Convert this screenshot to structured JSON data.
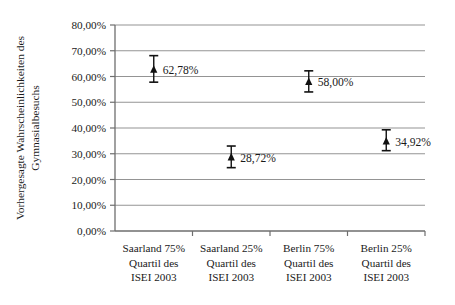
{
  "chart_data": {
    "type": "scatter",
    "title": "",
    "xlabel": "",
    "ylabel_lines": [
      "Vorhergesagte Wahrscheinlichkeiten des",
      "Gymnasialbesuchs"
    ],
    "ylabel": "Vorhergesagte Wahrscheinlichkeiten des Gymnasialbesuchs",
    "ylim": [
      0,
      80
    ],
    "ytick_values": [
      0,
      10,
      20,
      30,
      40,
      50,
      60,
      70,
      80
    ],
    "ytick_labels": [
      "0,00%",
      "10,00%",
      "20,00%",
      "30,00%",
      "40,00%",
      "50,00%",
      "60,00%",
      "70,00%",
      "80,00%"
    ],
    "grid": true,
    "legend": "none",
    "categories": [
      "Saarland 75% Quartil des ISEI 2003",
      "Saarland 25% Quartil des ISEI 2003",
      "Berlin 75% Quartil des ISEI 2003",
      "Berlin 25% Quartil des ISEI 2003"
    ],
    "category_label_lines": [
      [
        "Saarland 75%",
        "Quartil des",
        "ISEI 2003"
      ],
      [
        "Saarland 25%",
        "Quartil des",
        "ISEI 2003"
      ],
      [
        "Berlin 75%",
        "Quartil des",
        "ISEI 2003"
      ],
      [
        "Berlin 25%",
        "Quartil des",
        "ISEI 2003"
      ]
    ],
    "values": [
      62.78,
      28.72,
      58.0,
      34.92
    ],
    "value_labels": [
      "62,78%",
      "58,00%",
      "28,72%",
      "34,92%"
    ],
    "points": [
      {
        "category": "Saarland 75% Quartil des ISEI 2003",
        "value": 62.78,
        "label": "62,78%",
        "err_low": 57.8,
        "err_high": 68.1
      },
      {
        "category": "Saarland 25% Quartil des ISEI 2003",
        "value": 28.72,
        "label": "28,72%",
        "err_low": 24.6,
        "err_high": 33.0
      },
      {
        "category": "Berlin 75% Quartil des ISEI 2003",
        "value": 58.0,
        "label": "58,00%",
        "err_low": 54.0,
        "err_high": 62.2
      },
      {
        "category": "Berlin 25% Quartil des ISEI 2003",
        "value": 34.92,
        "label": "34,92%",
        "err_low": 31.2,
        "err_high": 39.3
      }
    ],
    "colors": {
      "background": "#ffffff",
      "grid": "#949494",
      "axis": "#6e6e6e",
      "marker": "#111111",
      "text": "#1a1a1a"
    }
  }
}
